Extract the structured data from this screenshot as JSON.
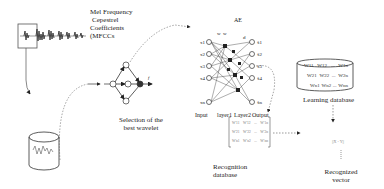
{
  "mfcc": {
    "line1": "Mel Frequency",
    "line2": "Cepestrel",
    "line3": "Coefficients",
    "line4": "(MFCCs"
  },
  "wavelet": {
    "label_line1": "Selection of the",
    "label_line2": "best wavelet",
    "node_label": "f"
  },
  "autoencoder": {
    "title": "AE",
    "inputs": [
      "x1",
      "x2",
      "x3",
      "x4",
      "xn"
    ],
    "outputs": [
      "x̂1",
      "x̂2",
      "x̂3",
      "x̂4",
      "x̂n"
    ],
    "top_labels": [
      "w",
      "w",
      "d"
    ],
    "layer_labels": [
      "Input",
      "layer1",
      "Layer2",
      "Output"
    ]
  },
  "recognition_db": {
    "label_line1": "Recognition",
    "label_line2": "database",
    "matrix_rows": [
      [
        "W'11",
        "W'12",
        "...",
        "W'1n"
      ],
      [
        "W'21",
        "W'22",
        "...",
        "W'2n"
      ],
      [
        "W'n1",
        "W'n2",
        "...",
        "W'nn"
      ]
    ]
  },
  "learning_db": {
    "label": "Learning database",
    "rows": [
      [
        "W11",
        "W12",
        "...",
        "W1n"
      ],
      [
        "W21",
        "W22",
        "...",
        "W2n"
      ],
      [
        "Wn1",
        "Wn2",
        "...",
        "Wnn"
      ]
    ]
  },
  "comparison": {
    "formula": "||X - Y||"
  },
  "result": {
    "label_line1": "Recognized",
    "label_line2": "vector"
  },
  "colors": {
    "line": "#333333",
    "dotted": "#555555",
    "waveform": "#444444"
  }
}
